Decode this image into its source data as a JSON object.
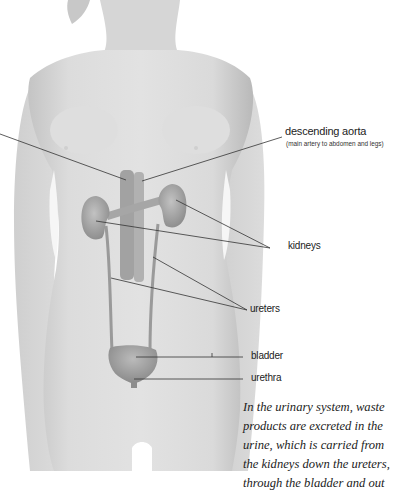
{
  "diagram": {
    "subject": "urinary system",
    "labels": {
      "aorta": "descending aorta",
      "aorta_note": "(main artery to abdomen and legs)",
      "kidneys": "kidneys",
      "ureters": "ureters",
      "bladder": "bladder",
      "urethra": "urethra"
    },
    "caption_lines": [
      "In the urinary system, waste",
      "products are excreted in the",
      "urine, which is carried from",
      "the kidneys down the ureters,",
      "through the bladder and out"
    ],
    "colors": {
      "skin": "#d9d9d9",
      "skin_shadow": "#bdbdbd",
      "organ": "#a9a9a9",
      "leader_line": "#333333",
      "background": "#ffffff"
    }
  }
}
